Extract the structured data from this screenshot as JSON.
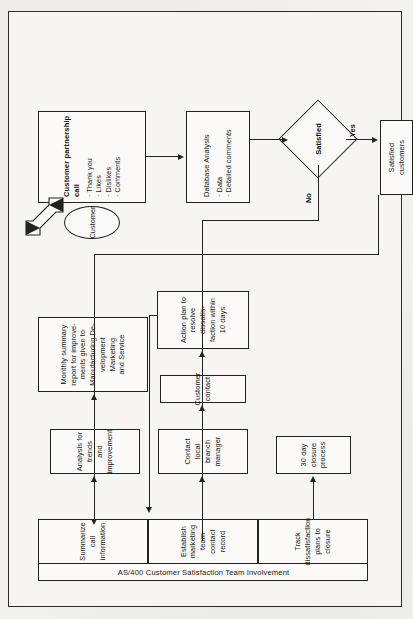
{
  "document": {
    "orientation": "rotated-90-ccw",
    "background_color": "#f4f3ef",
    "ink_color": "#23221f"
  },
  "swimlane": {
    "title": "AS/400 Customer Satisfaction Team Involvement",
    "activities": [
      {
        "id": "summarize",
        "label": "Summarize call\ninformation"
      },
      {
        "id": "establish",
        "label": "Establish marketing\nteam contact record"
      },
      {
        "id": "track",
        "label": "Track dissatisfaction\nplans to closure"
      }
    ]
  },
  "nodes": {
    "partnership_call": {
      "title": "Customer partnership call",
      "bullets": [
        "Thank you",
        "Likes",
        "Dislikes",
        "Comments"
      ]
    },
    "customer": {
      "label": "Customer"
    },
    "database_analysis": {
      "title": "Database Analysis",
      "bullets": [
        "Data",
        "Detailed comments"
      ]
    },
    "satisfied": {
      "label": "Satisfied"
    },
    "satisfied_customers": {
      "label": "Satisfied\ncustomers"
    },
    "analysis_trends": {
      "label": "Analysis for trends\nand improvement"
    },
    "monthly_summary": {
      "label": "Monthly summary\nreport for improve-\nments given to\nManufacturing De-\nvelopment Marketing\nand Service"
    },
    "contact_branch": {
      "label": "Contact local\nbranch manager"
    },
    "customer_contact": {
      "label": "Customer contact"
    },
    "action_plan": {
      "label": "Action plan to\nresolve dissatis-\nfaction within\n10 days"
    },
    "closure_process": {
      "label": "30 day\nclosure\nprocess"
    }
  },
  "edge_labels": {
    "no": "No",
    "yes": "Yes"
  }
}
